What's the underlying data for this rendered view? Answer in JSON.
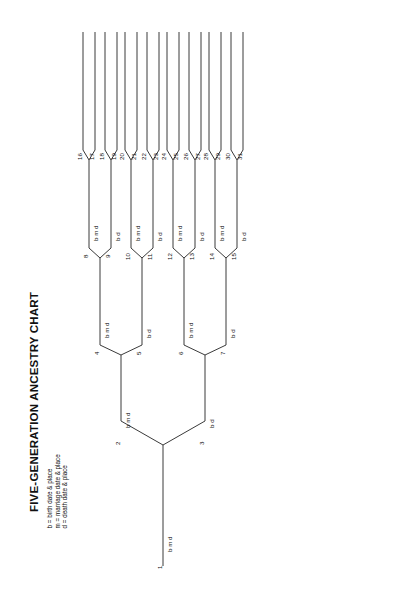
{
  "title": "FIVE-GENERATION ANCESTRY CHART",
  "legend": {
    "birth": "b = birth date & place",
    "marriage": "m = marriage date & place",
    "death": "d = death date & place"
  },
  "field_labels": {
    "b": "b",
    "m": "m",
    "d": "d"
  },
  "generations": [
    {
      "name": "generation-1",
      "persons": [
        {
          "number": "1",
          "fields": "b  m  d"
        }
      ]
    },
    {
      "name": "generation-2",
      "persons": [
        {
          "number": "2",
          "fields": "b  m  d"
        },
        {
          "number": "3",
          "fields": "b  d"
        }
      ]
    },
    {
      "name": "generation-3",
      "persons": [
        {
          "number": "4",
          "fields": "b  m  d"
        },
        {
          "number": "5",
          "fields": "b  d"
        },
        {
          "number": "6",
          "fields": "b  m  d"
        },
        {
          "number": "7",
          "fields": "b  d"
        }
      ]
    },
    {
      "name": "generation-4",
      "persons": [
        {
          "number": "8",
          "fields": "b  m  d"
        },
        {
          "number": "9",
          "fields": "b  d"
        },
        {
          "number": "10",
          "fields": "b  m  d"
        },
        {
          "number": "11",
          "fields": "b  d"
        },
        {
          "number": "12",
          "fields": "b  m  d"
        },
        {
          "number": "13",
          "fields": "b  d"
        },
        {
          "number": "14",
          "fields": "b  m  d"
        },
        {
          "number": "15",
          "fields": "b  d"
        }
      ]
    },
    {
      "name": "generation-5",
      "persons": [
        {
          "number": "16",
          "fields": ""
        },
        {
          "number": "17",
          "fields": ""
        },
        {
          "number": "18",
          "fields": ""
        },
        {
          "number": "19",
          "fields": ""
        },
        {
          "number": "20",
          "fields": ""
        },
        {
          "number": "21",
          "fields": ""
        },
        {
          "number": "22",
          "fields": ""
        },
        {
          "number": "23",
          "fields": ""
        },
        {
          "number": "24",
          "fields": ""
        },
        {
          "number": "25",
          "fields": ""
        },
        {
          "number": "26",
          "fields": ""
        },
        {
          "number": "27",
          "fields": ""
        },
        {
          "number": "28",
          "fields": ""
        },
        {
          "number": "29",
          "fields": ""
        },
        {
          "number": "30",
          "fields": ""
        },
        {
          "number": "31",
          "fields": ""
        }
      ]
    }
  ],
  "colors": {
    "ink": "#111111",
    "rule": "#3a3a3a",
    "background": "#ffffff"
  }
}
